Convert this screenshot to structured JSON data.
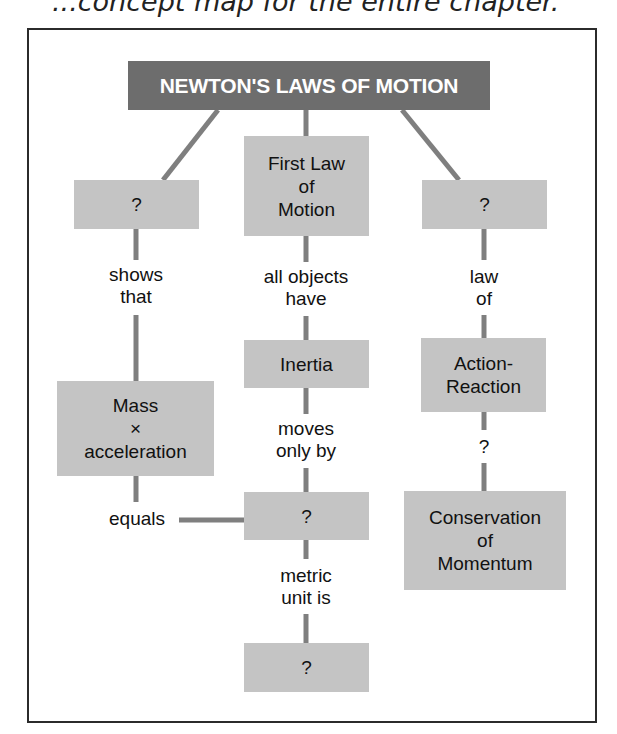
{
  "caption": "...concept map for the entire chapter.",
  "title": "NEWTON'S LAWS OF MOTION",
  "nodes": {
    "left_unknown": "?",
    "first_law": "First Law\nof\nMotion",
    "right_unknown": "?",
    "mass_accel": "Mass\n×\nacceleration",
    "inertia": "Inertia",
    "force_unknown": "?",
    "unit_unknown": "?",
    "action_reaction": "Action-\nReaction",
    "conservation": "Conservation\nof\nMomentum"
  },
  "links": {
    "shows_that": "shows\nthat",
    "all_objects_have": "all objects\nhave",
    "law_of": "law\nof",
    "moves_only_by": "moves\nonly by",
    "equals": "equals",
    "metric_unit_is": "metric\nunit is",
    "unknown_link": "?"
  },
  "colors": {
    "title_bg": "#6d6d6d",
    "node_bg": "#c4c4c4",
    "line": "#7f7f7f"
  }
}
